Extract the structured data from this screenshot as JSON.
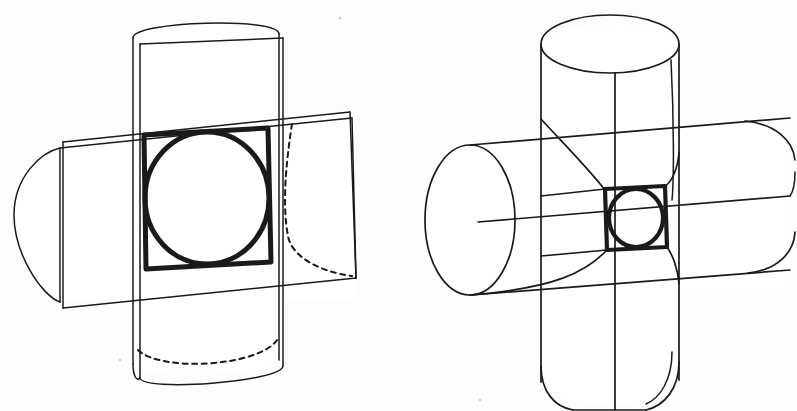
{
  "sheet": {
    "width": 797,
    "height": 411,
    "background_color": "#fdfdfd",
    "ink_color": "#1a1a1a",
    "media": "scanned line drawing"
  },
  "figures": [
    {
      "id": "left-figure",
      "name": "cut-away-intersecting-cylinders",
      "description": "Two equal cylinders intersecting at right angles, drawn in oblique/axonometric projection, sectioned so the square intersection window and the inscribed circle of intersection are exposed.",
      "center": {
        "x": 205,
        "y": 199
      },
      "features": {
        "bold_square": {
          "label": "intersection-square",
          "corners": [
            [
              144,
              134
            ],
            [
              268,
              128
            ],
            [
              271,
              262
            ],
            [
              146,
              268
            ]
          ],
          "stroke_weight": "bold"
        },
        "bold_circle": {
          "label": "intersection-circle",
          "cx": 207,
          "cy": 197,
          "rx": 62,
          "ry": 66,
          "stroke_weight": "bold"
        },
        "vertical_cylinder": {
          "label": "vertical-cylinder",
          "top_cap": "half-ellipse visible",
          "bottom_cap": "half-ellipse hidden (dashed)",
          "left_edge_x": 133,
          "right_edge_x": 279,
          "top_y": 20,
          "bottom_y": 380
        },
        "horizontal_cylinder": {
          "label": "horizontal-cylinder",
          "left_cap": "half-ellipse visible",
          "right_cap": "flat cut face with dashed hidden curve",
          "top_y": 120,
          "bottom_y": 300,
          "left_x": 14,
          "right_x": 355
        },
        "hidden_curves": [
          "right-arm-interior-curve",
          "bottom-cap-ellipse"
        ]
      }
    },
    {
      "id": "right-figure",
      "name": "solid-intersecting-cylinders",
      "description": "The same two equal cylinders intersecting at right angles shown complete and unsectioned, with the square intersection window and inscribed circle seen nearly edge-on at the centre.",
      "center": {
        "x": 620,
        "y": 210
      },
      "features": {
        "bold_square": {
          "label": "intersection-square",
          "corners": [
            [
              605,
              189
            ],
            [
              665,
              186
            ],
            [
              667,
              247
            ],
            [
              607,
              250
            ]
          ],
          "stroke_weight": "bold"
        },
        "bold_circle": {
          "label": "intersection-circle",
          "cx": 636,
          "cy": 218,
          "rx": 27,
          "ry": 29,
          "stroke_weight": "bold"
        },
        "vertical_cylinder": {
          "label": "vertical-cylinder",
          "top_cap": "full ellipse visible",
          "bottom_cap": "cropped by sheet edge",
          "top_y": 12,
          "bottom_y": 405
        },
        "horizontal_cylinder": {
          "label": "horizontal-cylinder",
          "left_cap": "full ellipse visible",
          "right_cap": "cropped by sheet edge",
          "left_x": 425,
          "right_x": 790
        },
        "intersection_curves": [
          "upper-left-saddle-curve",
          "lower-left-saddle-curve",
          "upper-right-saddle-curve",
          "lower-right-saddle-curve"
        ]
      }
    }
  ],
  "artifacts": [
    {
      "name": "scan-speck-top",
      "x": 340,
      "y": 18
    },
    {
      "name": "scan-speck-bottom-left",
      "x": 120,
      "y": 360
    },
    {
      "name": "scan-speck-bottom-right",
      "x": 480,
      "y": 400
    }
  ]
}
